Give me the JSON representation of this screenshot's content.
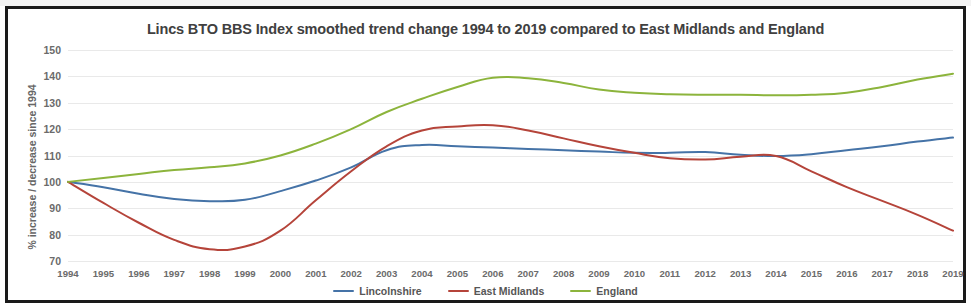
{
  "chart_data": {
    "type": "line",
    "title": "Lincs BTO BBS Index smoothed trend change 1994 to 2019 compared to East Midlands and England",
    "xlabel": "",
    "ylabel": "% increase / decrease since 1994",
    "ylim": [
      70,
      150
    ],
    "ytick_labels": [
      "150",
      "140",
      "130",
      "120",
      "110",
      "100",
      "90",
      "80",
      "70"
    ],
    "yticks": [
      150,
      140,
      130,
      120,
      110,
      100,
      90,
      80,
      70
    ],
    "grid": true,
    "legend_position": "bottom",
    "categories": [
      "1994",
      "1995",
      "1996",
      "1997",
      "1998",
      "1999",
      "2000",
      "2001",
      "2002",
      "2003",
      "2004",
      "2005",
      "2006",
      "2007",
      "2008",
      "2009",
      "2010",
      "2011",
      "2012",
      "2013",
      "2014",
      "2015",
      "2016",
      "2017",
      "2018",
      "2019"
    ],
    "x": [
      1994,
      1995,
      1996,
      1997,
      1998,
      1999,
      2000,
      2001,
      2002,
      2003,
      2004,
      2005,
      2006,
      2007,
      2008,
      2009,
      2010,
      2011,
      2012,
      2013,
      2014,
      2015,
      2016,
      2017,
      2018,
      2019
    ],
    "series": [
      {
        "name": "Lincolnshire",
        "color": "#4573a7",
        "values": [
          100.0,
          98.0,
          95.5,
          93.5,
          92.7,
          93.2,
          96.5,
          100.5,
          105.5,
          112.0,
          114.0,
          113.5,
          113.0,
          112.5,
          112.0,
          111.5,
          111.0,
          111.0,
          111.3,
          110.3,
          109.8,
          110.5,
          112.0,
          113.5,
          115.3,
          116.8
        ]
      },
      {
        "name": "East Midlands",
        "color": "#b5443a",
        "values": [
          100.0,
          92.0,
          84.5,
          78.0,
          74.5,
          75.5,
          81.5,
          93.0,
          104.0,
          113.5,
          119.5,
          121.0,
          121.5,
          119.5,
          116.5,
          113.5,
          111.0,
          109.0,
          108.5,
          109.5,
          109.8,
          104.0,
          98.0,
          92.8,
          87.5,
          81.5
        ]
      },
      {
        "name": "England",
        "color": "#8cb43c",
        "values": [
          100.0,
          101.5,
          103.0,
          104.5,
          105.5,
          107.0,
          110.0,
          114.5,
          120.0,
          126.5,
          131.5,
          136.0,
          139.5,
          139.3,
          137.5,
          135.0,
          133.8,
          133.2,
          133.0,
          133.0,
          132.8,
          133.0,
          133.8,
          136.0,
          138.8,
          141.0
        ]
      }
    ]
  },
  "legend": {
    "items": [
      {
        "label": "Lincolnshire",
        "color": "#4573a7"
      },
      {
        "label": "East Midlands",
        "color": "#b5443a"
      },
      {
        "label": "England",
        "color": "#8cb43c"
      }
    ]
  }
}
